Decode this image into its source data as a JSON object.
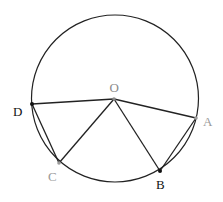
{
  "diagram": {
    "circle": {
      "cx": 115,
      "cy": 98.5,
      "r": 83.5,
      "stroke": "#222222"
    },
    "center": {
      "label": "O",
      "x": 114,
      "y": 99,
      "color": "#8a8a8a",
      "label_x": 114,
      "label_y": 92
    },
    "points": [
      {
        "id": "A",
        "label": "A",
        "x": 196,
        "y": 118,
        "color": "#9a9a9a",
        "label_x": 203,
        "label_y": 126
      },
      {
        "id": "B",
        "label": "B",
        "x": 160,
        "y": 171,
        "color": "#111111",
        "label_x": 156,
        "label_y": 189
      },
      {
        "id": "C",
        "label": "C",
        "x": 59,
        "y": 163,
        "color": "#9a9a9a",
        "label_x": 48,
        "label_y": 181
      },
      {
        "id": "D",
        "label": "D",
        "x": 32,
        "y": 104,
        "color": "#111111",
        "label_x": 13,
        "label_y": 116
      }
    ],
    "segments": [
      [
        "O",
        "D"
      ],
      [
        "O",
        "A"
      ],
      [
        "O",
        "C"
      ],
      [
        "O",
        "B"
      ],
      [
        "D",
        "C"
      ],
      [
        "A",
        "B"
      ]
    ]
  }
}
